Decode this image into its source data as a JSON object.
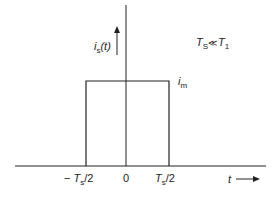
{
  "diagram": {
    "type": "rectangular-pulse",
    "y_axis_label": {
      "main": "i",
      "sub": "s",
      "arg": "(t)"
    },
    "x_axis_label": "t",
    "amplitude_label": {
      "main": "i",
      "sub": "m"
    },
    "condition": {
      "left": "T",
      "left_sub": "S",
      "relation": "≪",
      "right": "T",
      "right_sub": "1"
    },
    "ticks": [
      {
        "prefix": "− ",
        "main": "T",
        "sub": "s",
        "suffix": "/2"
      },
      {
        "prefix": "",
        "main": "0",
        "sub": "",
        "suffix": ""
      },
      {
        "prefix": "",
        "main": "T",
        "sub": "s",
        "suffix": "/2"
      }
    ],
    "colors": {
      "line": "#222222",
      "background": "#ffffff"
    }
  }
}
